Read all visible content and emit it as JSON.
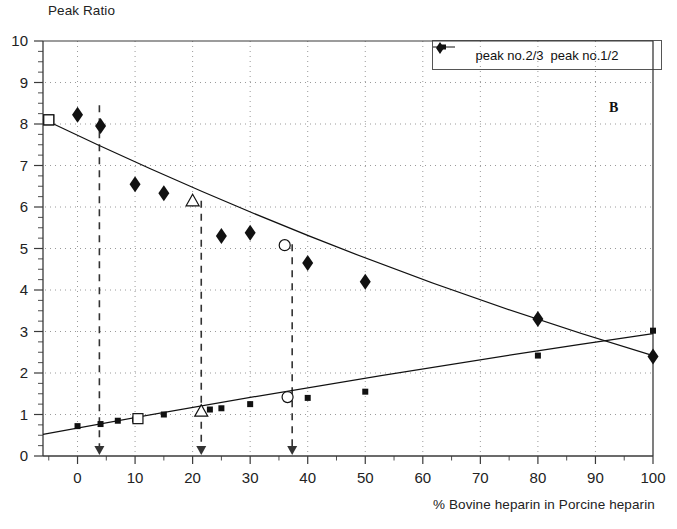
{
  "chart_data": {
    "type": "scatter",
    "title": "",
    "panel_label": "B",
    "ylabel": "Peak Ratio",
    "xlabel": "% Bovine heparin in Porcine heparin",
    "xlim": [
      -6,
      100
    ],
    "ylim": [
      0,
      10
    ],
    "xticks": [
      0,
      10,
      20,
      30,
      40,
      50,
      60,
      70,
      80,
      90,
      100
    ],
    "xtick_labels": [
      "0",
      "10",
      "20",
      "30",
      "40",
      "50",
      "60",
      "70",
      "80",
      "90",
      "100"
    ],
    "yticks": [
      0,
      1,
      2,
      3,
      4,
      5,
      6,
      7,
      8,
      9,
      10
    ],
    "ytick_labels": [
      "0",
      "1",
      "2",
      "3",
      "4",
      "5",
      "6",
      "7",
      "8",
      "9",
      "10"
    ],
    "grid": "dotted-horizontal-and-vertical",
    "legend_position": "top-right",
    "series": [
      {
        "name": "peak no.2/3",
        "marker": "small-filled-square",
        "points": [
          {
            "x": -5.0,
            "y": 8.1,
            "marker": "open-square"
          },
          {
            "x": 0.0,
            "y": 0.72
          },
          {
            "x": 4.0,
            "y": 0.77
          },
          {
            "x": 7.0,
            "y": 0.85
          },
          {
            "x": 10.0,
            "y": 0.88
          },
          {
            "x": 10.5,
            "y": 0.9,
            "marker": "open-square"
          },
          {
            "x": 15.0,
            "y": 1.0
          },
          {
            "x": 21.5,
            "y": 1.08,
            "marker": "open-triangle"
          },
          {
            "x": 23.0,
            "y": 1.12
          },
          {
            "x": 25.0,
            "y": 1.15
          },
          {
            "x": 30.0,
            "y": 1.25
          },
          {
            "x": 36.5,
            "y": 1.42,
            "marker": "open-circle"
          },
          {
            "x": 40.0,
            "y": 1.4
          },
          {
            "x": 50.0,
            "y": 1.55
          },
          {
            "x": 80.0,
            "y": 2.42
          },
          {
            "x": 100.0,
            "y": 3.02
          }
        ],
        "fit_line": [
          {
            "x": -6,
            "y": 0.52
          },
          {
            "x": 100,
            "y": 2.95
          }
        ]
      },
      {
        "name": "peak no.1/2",
        "marker": "filled-diamond",
        "points": [
          {
            "x": -5.0,
            "y": 8.1,
            "marker": "open-square"
          },
          {
            "x": 0.0,
            "y": 8.22
          },
          {
            "x": 4.0,
            "y": 7.95
          },
          {
            "x": 10.0,
            "y": 6.55
          },
          {
            "x": 15.0,
            "y": 6.33
          },
          {
            "x": 20.0,
            "y": 6.15,
            "marker": "open-triangle"
          },
          {
            "x": 25.0,
            "y": 5.3
          },
          {
            "x": 30.0,
            "y": 5.38
          },
          {
            "x": 36.0,
            "y": 5.08,
            "marker": "open-circle"
          },
          {
            "x": 40.0,
            "y": 4.65
          },
          {
            "x": 50.0,
            "y": 4.2
          },
          {
            "x": 80.0,
            "y": 3.3
          },
          {
            "x": 100.0,
            "y": 2.4
          }
        ],
        "fit_line": [
          {
            "x": -6,
            "y": 8.12
          },
          {
            "x": 100,
            "y": 2.42
          }
        ]
      }
    ],
    "annotations": [
      {
        "type": "dashed-vertical-with-arrow",
        "x": 3.8,
        "y_top": 8.45,
        "label": ""
      },
      {
        "type": "dashed-vertical-with-arrow",
        "x": 21.5,
        "y_top": 6.15,
        "label": ""
      },
      {
        "type": "dashed-vertical-with-arrow",
        "x": 37.3,
        "y_top": 5.1,
        "label": ""
      }
    ]
  },
  "legend": {
    "items": [
      {
        "label": "peak no.2/3",
        "marker": "line-with-square"
      },
      {
        "label": "peak no.1/2",
        "marker": "filled-diamond"
      }
    ]
  },
  "colors": {
    "axis": "#3a3a3a",
    "grid": "#9a9a9a",
    "series1": "#111111",
    "series2": "#111111",
    "annotation": "#333333",
    "background": "#ffffff"
  }
}
